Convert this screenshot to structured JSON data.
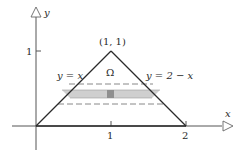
{
  "figure": {
    "type": "region-of-integration",
    "axes": {
      "x_label": "x",
      "y_label": "y",
      "x_ticks": [
        {
          "value": 1,
          "label": "1"
        },
        {
          "value": 2,
          "label": "2"
        }
      ],
      "y_ticks": [
        {
          "value": 1,
          "label": "1"
        }
      ]
    },
    "vertex_label": "(1, 1)",
    "region_label": "Ω",
    "left_edge_label": "y = x",
    "right_edge_label": "y = 2 − x",
    "region": {
      "vertices": [
        [
          0,
          0
        ],
        [
          1,
          1
        ],
        [
          2,
          0
        ]
      ],
      "shape": "triangle"
    },
    "dashed_lines_y": [
      0.56,
      0.29
    ],
    "shaded_strip": {
      "y_from": 0.37,
      "y_to": 0.48,
      "highlight_x": 1.0
    },
    "colors": {
      "line": "#2a2a2a",
      "axis": "#555555",
      "strip": "#c8c8c8",
      "strip_highlight": "#8a8a8a",
      "dash": "#6a6a6a"
    }
  }
}
